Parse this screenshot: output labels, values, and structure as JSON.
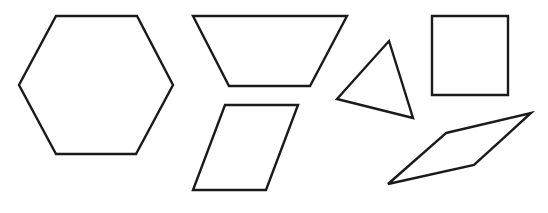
{
  "diagram": {
    "width": 548,
    "height": 213,
    "stroke_color": "#1a1a1a",
    "stroke_width": 2.4,
    "background": "#ffffff",
    "shapes": [
      {
        "name": "hexagon",
        "points": "56,16 137,16 173,85 136,154 56,154 19,85"
      },
      {
        "name": "trapezoid",
        "points": "193,16 347,16 310,86 229,86"
      },
      {
        "name": "parallelogram",
        "points": "225,105 298,105 266,190 193,190"
      },
      {
        "name": "triangle",
        "points": "389,41 413,118 337,99"
      },
      {
        "name": "square",
        "points": "432,16 508,16 508,95 432,95"
      },
      {
        "name": "rhombus",
        "points": "446,133 531,113 474,165 388,184"
      }
    ]
  }
}
